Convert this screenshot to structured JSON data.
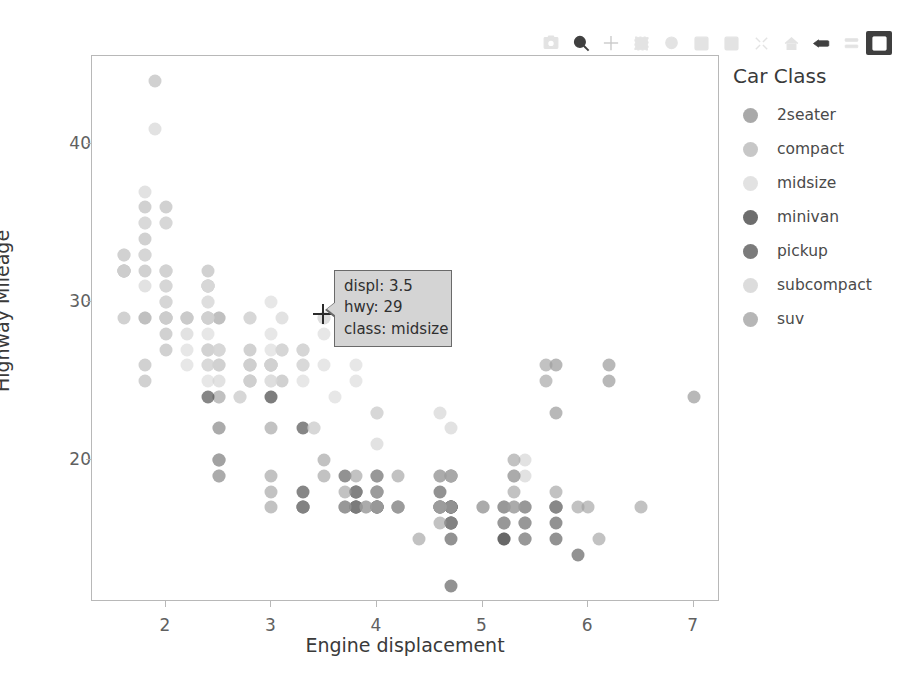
{
  "chart_data": {
    "type": "scatter",
    "title": "",
    "xlabel": "Engine displacement",
    "ylabel": "Highway Mileage",
    "xlim": [
      1.3,
      7.25
    ],
    "ylim": [
      11.0,
      45.6
    ],
    "xticks": [
      2,
      3,
      4,
      5,
      6,
      7
    ],
    "yticks": [
      20,
      30,
      40
    ],
    "grid": false,
    "legend_title": "Car Class",
    "legend_position": "right",
    "marker_size": 13,
    "marker_opacity": 0.62,
    "series": [
      {
        "name": "2seater",
        "color": "#8c8c8c",
        "points": [
          [
            5.7,
            26
          ],
          [
            5.7,
            23
          ],
          [
            6.2,
            26
          ],
          [
            6.2,
            25
          ],
          [
            7.0,
            24
          ]
        ]
      },
      {
        "name": "compact",
        "color": "#b4b4b4",
        "points": [
          [
            1.8,
            29
          ],
          [
            1.8,
            29
          ],
          [
            2.0,
            31
          ],
          [
            2.0,
            30
          ],
          [
            2.8,
            26
          ],
          [
            2.8,
            26
          ],
          [
            3.1,
            27
          ],
          [
            1.8,
            26
          ],
          [
            1.8,
            25
          ],
          [
            2.0,
            28
          ],
          [
            2.0,
            27
          ],
          [
            2.8,
            25
          ],
          [
            2.8,
            25
          ],
          [
            3.1,
            25
          ],
          [
            1.6,
            33
          ],
          [
            1.6,
            32
          ],
          [
            1.6,
            32
          ],
          [
            1.6,
            29
          ],
          [
            1.6,
            32
          ],
          [
            1.8,
            34
          ],
          [
            1.8,
            36
          ],
          [
            2.0,
            36
          ],
          [
            2.4,
            29
          ],
          [
            2.4,
            27
          ],
          [
            2.5,
            24
          ],
          [
            2.5,
            24
          ],
          [
            2.4,
            32
          ],
          [
            2.4,
            29
          ],
          [
            2.5,
            27
          ],
          [
            2.5,
            26
          ],
          [
            2.2,
            29
          ],
          [
            2.2,
            29
          ],
          [
            2.4,
            31
          ],
          [
            2.4,
            31
          ],
          [
            3.0,
            26
          ],
          [
            3.0,
            26
          ],
          [
            3.3,
            27
          ],
          [
            1.8,
            33
          ],
          [
            1.8,
            32
          ],
          [
            2.0,
            32
          ],
          [
            2.0,
            29
          ],
          [
            2.8,
            27
          ],
          [
            1.9,
            44
          ],
          [
            2.0,
            29
          ],
          [
            2.0,
            29
          ],
          [
            2.5,
            29
          ],
          [
            2.5,
            29
          ]
        ]
      },
      {
        "name": "midsize",
        "color": "#d8d8d8",
        "points": [
          [
            2.4,
            31
          ],
          [
            3.0,
            30
          ],
          [
            3.5,
            29
          ],
          [
            2.4,
            30
          ],
          [
            3.0,
            26
          ],
          [
            3.5,
            28
          ],
          [
            2.0,
            31
          ],
          [
            2.0,
            30
          ],
          [
            2.4,
            28
          ],
          [
            2.4,
            27
          ],
          [
            3.1,
            27
          ],
          [
            3.5,
            26
          ],
          [
            2.5,
            27
          ],
          [
            2.5,
            27
          ],
          [
            2.4,
            31
          ],
          [
            2.4,
            31
          ],
          [
            3.0,
            28
          ],
          [
            3.0,
            27
          ],
          [
            3.3,
            26
          ],
          [
            3.3,
            27
          ],
          [
            3.8,
            26
          ],
          [
            1.8,
            33
          ],
          [
            1.8,
            35
          ],
          [
            2.0,
            32
          ],
          [
            2.0,
            29
          ],
          [
            2.8,
            26
          ],
          [
            2.8,
            25
          ],
          [
            3.6,
            24
          ],
          [
            2.4,
            29
          ],
          [
            2.4,
            30
          ],
          [
            3.0,
            26
          ],
          [
            3.0,
            25
          ],
          [
            3.3,
            25
          ],
          [
            3.5,
            29
          ],
          [
            3.8,
            25
          ],
          [
            2.2,
            26
          ],
          [
            2.2,
            27
          ],
          [
            2.4,
            26
          ],
          [
            2.4,
            25
          ],
          [
            3.0,
            24
          ],
          [
            3.0,
            25
          ]
        ]
      },
      {
        "name": "minivan",
        "color": "#3c3c3c",
        "points": [
          [
            2.4,
            24
          ],
          [
            3.0,
            24
          ],
          [
            3.3,
            22
          ],
          [
            3.8,
            18
          ],
          [
            3.8,
            18
          ],
          [
            3.8,
            17
          ],
          [
            4.0,
            17
          ],
          [
            3.3,
            18
          ],
          [
            3.3,
            17
          ],
          [
            3.8,
            17
          ],
          [
            3.8,
            17
          ],
          [
            3.3,
            17
          ]
        ]
      },
      {
        "name": "pickup",
        "color": "#4f4f4f",
        "points": [
          [
            4.7,
            19
          ],
          [
            5.7,
            17
          ],
          [
            4.7,
            17
          ],
          [
            5.7,
            17
          ],
          [
            4.7,
            19
          ],
          [
            4.7,
            17
          ],
          [
            5.2,
            17
          ],
          [
            3.7,
            19
          ],
          [
            4.0,
            18
          ],
          [
            4.7,
            17
          ],
          [
            4.7,
            17
          ],
          [
            4.7,
            16
          ],
          [
            4.7,
            15
          ],
          [
            5.2,
            16
          ],
          [
            5.2,
            15
          ],
          [
            5.7,
            16
          ],
          [
            3.7,
            17
          ],
          [
            4.0,
            17
          ],
          [
            4.7,
            16
          ],
          [
            4.7,
            16
          ],
          [
            5.2,
            15
          ],
          [
            5.7,
            15
          ],
          [
            5.9,
            14
          ],
          [
            4.7,
            12
          ],
          [
            4.7,
            17
          ],
          [
            4.0,
            17
          ],
          [
            4.6,
            17
          ],
          [
            5.4,
            16
          ],
          [
            5.4,
            15
          ],
          [
            4.0,
            19
          ],
          [
            4.2,
            17
          ],
          [
            4.6,
            17
          ],
          [
            4.6,
            18
          ],
          [
            5.4,
            17
          ]
        ]
      },
      {
        "name": "subcompact",
        "color": "#d0d0d0",
        "points": [
          [
            1.8,
            37
          ],
          [
            1.8,
            35
          ],
          [
            2.0,
            35
          ],
          [
            2.0,
            35
          ],
          [
            2.8,
            29
          ],
          [
            2.8,
            29
          ],
          [
            3.1,
            29
          ],
          [
            1.6,
            33
          ],
          [
            1.6,
            32
          ],
          [
            1.6,
            32
          ],
          [
            1.8,
            31
          ],
          [
            2.0,
            32
          ],
          [
            2.4,
            27
          ],
          [
            2.4,
            26
          ],
          [
            2.5,
            26
          ],
          [
            2.5,
            25
          ],
          [
            1.9,
            41
          ],
          [
            2.2,
            29
          ],
          [
            2.2,
            28
          ],
          [
            2.4,
            29
          ],
          [
            2.4,
            29
          ],
          [
            3.0,
            26
          ],
          [
            3.0,
            26
          ],
          [
            3.3,
            26
          ],
          [
            4.0,
            23
          ],
          [
            4.0,
            23
          ],
          [
            4.6,
            23
          ],
          [
            5.4,
            20
          ],
          [
            5.4,
            19
          ],
          [
            2.7,
            24
          ],
          [
            2.7,
            24
          ],
          [
            3.4,
            22
          ],
          [
            3.4,
            22
          ],
          [
            4.0,
            21
          ],
          [
            4.7,
            22
          ],
          [
            4.7,
            19
          ]
        ]
      },
      {
        "name": "suv",
        "color": "#9d9d9d",
        "points": [
          [
            2.5,
            20
          ],
          [
            2.5,
            19
          ],
          [
            2.5,
            20
          ],
          [
            2.5,
            20
          ],
          [
            2.5,
            19
          ],
          [
            3.7,
            17
          ],
          [
            4.0,
            17
          ],
          [
            3.0,
            22
          ],
          [
            3.7,
            18
          ],
          [
            4.0,
            18
          ],
          [
            4.0,
            17
          ],
          [
            4.6,
            17
          ],
          [
            4.6,
            16
          ],
          [
            4.6,
            17
          ],
          [
            5.4,
            16
          ],
          [
            5.4,
            15
          ],
          [
            2.5,
            22
          ],
          [
            2.5,
            22
          ],
          [
            3.0,
            19
          ],
          [
            3.0,
            18
          ],
          [
            3.5,
            19
          ],
          [
            3.5,
            20
          ],
          [
            3.8,
            19
          ],
          [
            3.8,
            18
          ],
          [
            4.0,
            17
          ],
          [
            4.0,
            18
          ],
          [
            4.2,
            17
          ],
          [
            4.4,
            15
          ],
          [
            4.6,
            17
          ],
          [
            4.6,
            17
          ],
          [
            5.0,
            17
          ],
          [
            5.3,
            18
          ],
          [
            5.3,
            17
          ],
          [
            5.3,
            17
          ],
          [
            5.7,
            18
          ],
          [
            5.7,
            17
          ],
          [
            6.0,
            17
          ],
          [
            6.1,
            15
          ],
          [
            6.5,
            17
          ],
          [
            3.9,
            17
          ],
          [
            4.7,
            17
          ],
          [
            4.7,
            16
          ],
          [
            5.2,
            16
          ],
          [
            5.2,
            17
          ],
          [
            5.3,
            20
          ],
          [
            4.2,
            17
          ],
          [
            4.6,
            17
          ],
          [
            5.4,
            17
          ],
          [
            5.3,
            19
          ],
          [
            5.3,
            19
          ],
          [
            5.9,
            17
          ],
          [
            4.7,
            17
          ],
          [
            4.0,
            19
          ],
          [
            3.8,
            17
          ],
          [
            3.0,
            17
          ],
          [
            3.3,
            17
          ],
          [
            5.6,
            26
          ],
          [
            5.6,
            25
          ],
          [
            4.6,
            19
          ],
          [
            4.6,
            19
          ],
          [
            5.0,
            17
          ],
          [
            3.9,
            17
          ],
          [
            4.2,
            19
          ]
        ]
      }
    ]
  },
  "modebar": {
    "buttons": [
      {
        "name": "camera-icon",
        "label": "Download plot as a png",
        "state": "dim"
      },
      {
        "name": "zoom-magnifier-icon",
        "label": "Zoom",
        "state": "on"
      },
      {
        "name": "pan-crosshair-icon",
        "label": "Pan",
        "state": "mid"
      },
      {
        "name": "box-select-icon",
        "label": "Box Select",
        "state": "dim"
      },
      {
        "name": "lasso-select-icon",
        "label": "Lasso Select",
        "state": "dim"
      },
      {
        "name": "zoom-in-plus-icon",
        "label": "Zoom in",
        "state": "dim"
      },
      {
        "name": "zoom-out-minus-icon",
        "label": "Zoom out",
        "state": "dim"
      },
      {
        "name": "autoscale-icon",
        "label": "Autoscale",
        "state": "dim"
      },
      {
        "name": "home-reset-axes-icon",
        "label": "Reset axes",
        "state": "dim"
      },
      {
        "name": "toggle-spike-lines-icon",
        "label": "Toggle Spike Lines",
        "state": "on"
      },
      {
        "name": "hover-compare-data-icon",
        "label": "Compare data on hover",
        "state": "dim"
      },
      {
        "name": "hover-closest-data-icon",
        "label": "Show closest data on hover",
        "state": "active"
      }
    ]
  },
  "legend": {
    "title": "Car Class",
    "items": [
      {
        "label": "2seater",
        "color": "#8c8c8c"
      },
      {
        "label": "compact",
        "color": "#b4b4b4"
      },
      {
        "label": "midsize",
        "color": "#d8d8d8"
      },
      {
        "label": "minivan",
        "color": "#3c3c3c"
      },
      {
        "label": "pickup",
        "color": "#4f4f4f"
      },
      {
        "label": "subcompact",
        "color": "#d0d0d0"
      },
      {
        "label": "suv",
        "color": "#9d9d9d"
      }
    ]
  },
  "tooltip": {
    "line1": "displ: 3.5",
    "line2": "hwy: 29",
    "line3": "class: midsize",
    "bg_color": "#d4d4d4",
    "border_color": "#6a6a6a"
  },
  "axes": {
    "x_title": "Engine displacement",
    "y_title": "Highway Mileage",
    "x_ticklabels": [
      "2",
      "3",
      "4",
      "5",
      "6",
      "7"
    ],
    "y_ticklabels": [
      "20",
      "30",
      "40"
    ]
  }
}
